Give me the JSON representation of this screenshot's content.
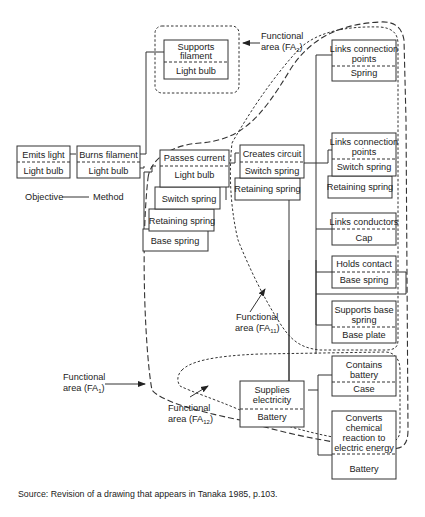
{
  "diagram": {
    "boxes": {
      "emits_light": {
        "func": [
          "Emits light"
        ],
        "obj": "Light bulb"
      },
      "burns_filament": {
        "func": [
          "Burns filament"
        ],
        "obj": "Light bulb"
      },
      "supports_filament": {
        "func": [
          "Supports",
          "filament"
        ],
        "obj": "Light bulb"
      },
      "passes_current": {
        "func": [
          "Passes current"
        ],
        "obj": "Light bulb",
        "stack": [
          "Switch spring",
          "Retaining spring",
          "Base spring"
        ]
      },
      "creates_circuit": {
        "func": [
          "Creates circuit"
        ],
        "obj": "Switch spring",
        "stack": [
          "Retaining spring"
        ]
      },
      "links_connection_spring": {
        "func": [
          "Links connection",
          "points"
        ],
        "obj": "Spring"
      },
      "links_connection_switch": {
        "func": [
          "Links connection",
          "points"
        ],
        "obj": "Switch spring",
        "stack": [
          "Retaining spring"
        ]
      },
      "links_conductors": {
        "func": [
          "Links conductors"
        ],
        "obj": "Cap"
      },
      "holds_contact": {
        "func": [
          "Holds contact"
        ],
        "obj": "Base spring"
      },
      "supports_base_spring": {
        "func": [
          "Supports base",
          "spring"
        ],
        "obj": "Base plate"
      },
      "supplies_electricity": {
        "func": [
          "Supplies",
          "electricity"
        ],
        "obj": "Battery"
      },
      "contains_battery": {
        "func": [
          "Contains",
          "battery"
        ],
        "obj": "Case"
      },
      "converts_chemical": {
        "func": [
          "Converts",
          "chemical",
          "reaction to",
          "electric energy"
        ],
        "obj": "Battery"
      }
    },
    "legend": {
      "left": "Objective",
      "right": "Method"
    },
    "functional_areas": {
      "fa2": {
        "line1": "Functional",
        "line2": "area (FA",
        "sub": "2",
        "close": ")"
      },
      "fa11": {
        "line1": "Functional",
        "line2": "area (FA",
        "sub": "11",
        "close": ")"
      },
      "fa1": {
        "line1": "Functional",
        "line2": "area (FA",
        "sub": "1",
        "close": ")"
      },
      "fa12": {
        "line1": "Functional",
        "line2": "area (FA",
        "sub": "12",
        "close": ")"
      }
    },
    "source": "Source: Revision of a drawing that appears in Tanaka 1985, p.103."
  }
}
